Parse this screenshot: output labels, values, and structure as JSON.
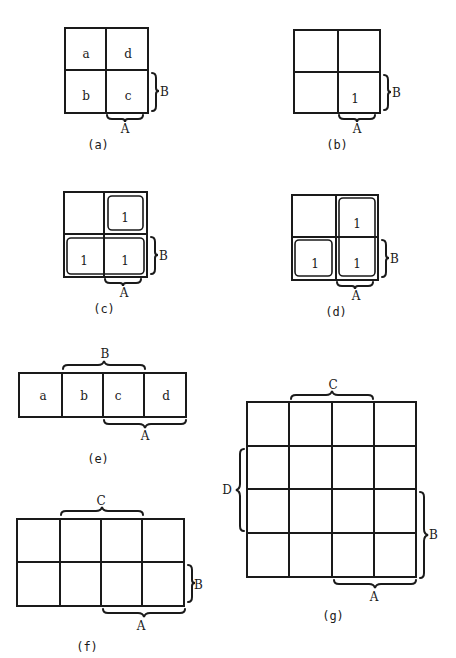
{
  "figures": [
    {
      "id": "a",
      "caption": "(a)",
      "type": "2x2 K-map",
      "cells": [
        "a",
        "d",
        "b",
        "c"
      ],
      "brace_right": "B",
      "brace_bottom": "A"
    },
    {
      "id": "b",
      "caption": "(b)",
      "type": "2x2 K-map",
      "cells": [
        "",
        "",
        "",
        "1"
      ],
      "brace_right": "B",
      "brace_bottom": "A"
    },
    {
      "id": "c",
      "caption": "(c)",
      "type": "2x2 K-map with groupings",
      "cells": [
        "",
        "1",
        "1",
        "1"
      ],
      "brace_right": "B",
      "brace_bottom": "A"
    },
    {
      "id": "d",
      "caption": "(d)",
      "type": "2x2 K-map with groupings",
      "cells": [
        "",
        "1",
        "1",
        "1"
      ],
      "brace_right": "B",
      "brace_bottom": "A"
    },
    {
      "id": "e",
      "caption": "(e)",
      "type": "1x4 K-map",
      "cells": [
        "a",
        "b",
        "c",
        "d"
      ],
      "brace_top": "B",
      "brace_bottom": "A"
    },
    {
      "id": "f",
      "caption": "(f)",
      "type": "2x4 K-map",
      "brace_top": "C",
      "brace_right": "B",
      "brace_bottom": "A"
    },
    {
      "id": "g",
      "caption": "(g)",
      "type": "4x4 K-map",
      "brace_top": "C",
      "brace_left": "D",
      "brace_right": "B",
      "brace_bottom": "A"
    }
  ]
}
